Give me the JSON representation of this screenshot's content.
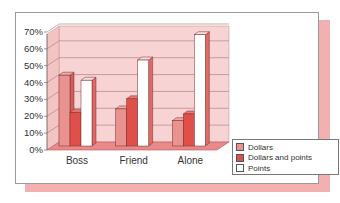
{
  "chart_data": {
    "type": "bar",
    "title": "",
    "xlabel": "",
    "ylabel": "",
    "categories": [
      "Boss",
      "Friend",
      "Alone"
    ],
    "series": [
      {
        "name": "Dollars",
        "values": [
          42,
          22,
          15
        ],
        "color": "#e8938f"
      },
      {
        "name": "Dollars and points",
        "values": [
          20,
          28,
          19
        ],
        "color": "#e0504a"
      },
      {
        "name": "Points",
        "values": [
          39,
          51,
          66
        ],
        "color": "#ffffff"
      }
    ],
    "ylim": [
      0,
      70
    ],
    "yticks": [
      "0%",
      "10%",
      "20%",
      "30%",
      "40%",
      "50%",
      "60%",
      "70%"
    ],
    "grid": true,
    "legend_position": "bottom-right",
    "style": "3d-clustered-column"
  },
  "legend": {
    "items": [
      {
        "label": "Dollars",
        "color": "#e8938f"
      },
      {
        "label": "Dollars and points",
        "color": "#e0504a"
      },
      {
        "label": "Points",
        "color": "#ffffff"
      }
    ]
  },
  "colors": {
    "wall": "#f7d3d3",
    "floor": "#e88a8a",
    "shadow": "#f2b0b0",
    "border": "#9a9a9a"
  }
}
